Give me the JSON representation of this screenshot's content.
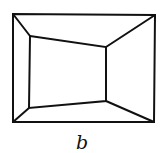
{
  "diagram": {
    "type": "room-perspective-line-drawing",
    "caption": "b",
    "stroke_color": "#111111",
    "background": "#ffffff",
    "outer_rectangle": {
      "top_left": [
        13,
        14
      ],
      "top_right": [
        155,
        15
      ],
      "bottom_right": [
        154,
        122
      ],
      "bottom_left": [
        13,
        122
      ]
    },
    "inner_quadrilateral": {
      "top_left": [
        30,
        36
      ],
      "top_right": [
        106,
        47
      ],
      "bottom_right": [
        106,
        101
      ],
      "bottom_left": [
        29,
        108
      ]
    }
  }
}
